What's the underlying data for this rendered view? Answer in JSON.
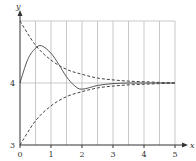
{
  "chart_data": {
    "type": "line",
    "title": "",
    "xlabel": "x",
    "ylabel": "y",
    "xlim": [
      0,
      5
    ],
    "ylim": [
      3,
      5
    ],
    "x_ticks": [
      "0",
      "1",
      "2",
      "3",
      "4",
      "5"
    ],
    "y_ticks": [
      "3",
      "4"
    ],
    "grid": {
      "vertical_every": 0.5,
      "horizontal_lines": [
        4,
        5
      ]
    },
    "legend": null,
    "series": [
      {
        "name": "upper-envelope",
        "style": "dashed",
        "x": [
          0,
          0.5,
          1,
          1.5,
          2,
          2.5,
          3,
          3.5,
          4,
          4.5,
          5
        ],
        "values": [
          5.0,
          4.61,
          4.37,
          4.22,
          4.14,
          4.08,
          4.05,
          4.03,
          4.02,
          4.01,
          4.0
        ]
      },
      {
        "name": "lower-envelope",
        "style": "dashed",
        "x": [
          0,
          0.5,
          1,
          1.5,
          2,
          2.5,
          3,
          3.5,
          4,
          4.5,
          5
        ],
        "values": [
          3.0,
          3.39,
          3.63,
          3.78,
          3.86,
          3.92,
          3.95,
          3.97,
          3.98,
          3.99,
          4.0
        ]
      },
      {
        "name": "solution",
        "style": "solid",
        "x": [
          0,
          0.25,
          0.5,
          0.7,
          1,
          1.25,
          1.5,
          1.75,
          2,
          2.5,
          3,
          3.5,
          4,
          4.5,
          5
        ],
        "values": [
          4.0,
          4.38,
          4.56,
          4.6,
          4.48,
          4.3,
          4.1,
          3.96,
          3.9,
          3.96,
          3.99,
          4.0,
          4.0,
          4.0,
          4.0
        ]
      }
    ],
    "axis_labels": {
      "x": "x",
      "y": "y"
    }
  },
  "colors": {
    "axis": "#333333",
    "grid": "#bbbbbb",
    "curve": "#555555",
    "dashed": "#444444"
  }
}
